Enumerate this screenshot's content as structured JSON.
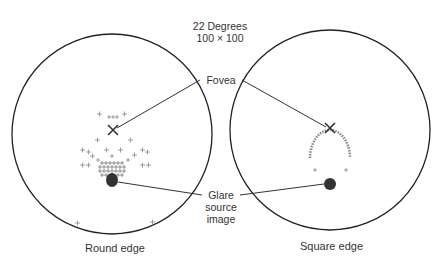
{
  "header": {
    "line1": "22 Degrees",
    "line2": "100 × 100"
  },
  "labels": {
    "fovea": "Fovea",
    "glare_line1": "Glare",
    "glare_line2": "source",
    "glare_line3": "image"
  },
  "panels": [
    {
      "caption": "Round edge",
      "center": [
        112,
        134
      ],
      "radius": 100,
      "fovea_marker": [
        113,
        130
      ],
      "glare_blob": [
        112,
        180
      ]
    },
    {
      "caption": "Square edge",
      "center": [
        330,
        130
      ],
      "radius": 100,
      "fovea_marker": [
        330,
        128
      ],
      "glare_blob": [
        330,
        184
      ]
    }
  ],
  "colors": {
    "stroke": "#222222",
    "points": "#777777",
    "blob": "#333333"
  }
}
